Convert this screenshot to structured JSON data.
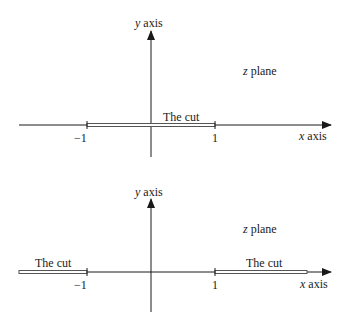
{
  "diagrams": [
    {
      "id": "top",
      "plane_label_var": "z",
      "plane_label_word": "plane",
      "y_axis_var": "y",
      "y_axis_word": "axis",
      "x_axis_var": "x",
      "x_axis_word": "axis",
      "tick_minus_one": "−1",
      "tick_one": "1",
      "cuts": [
        {
          "label": "The cut",
          "from": -1,
          "to": 1
        }
      ]
    },
    {
      "id": "bottom",
      "plane_label_var": "z",
      "plane_label_word": "plane",
      "y_axis_var": "y",
      "y_axis_word": "axis",
      "x_axis_var": "x",
      "x_axis_word": "axis",
      "tick_minus_one": "−1",
      "tick_one": "1",
      "cuts": [
        {
          "label": "The cut",
          "from": "-infinity",
          "to": -1
        },
        {
          "label": "The cut",
          "from": 1,
          "to": "infinity"
        }
      ]
    }
  ],
  "colors": {
    "ink": "#1a1a1a",
    "cut": "#555555"
  }
}
